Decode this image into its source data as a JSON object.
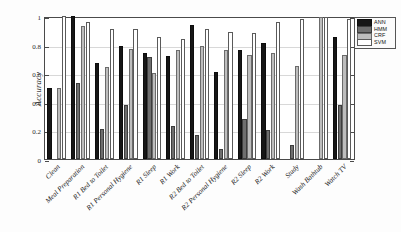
{
  "chart_data": {
    "type": "bar",
    "title": "",
    "xlabel": "",
    "ylabel": "Accuracy",
    "ylim": [
      0,
      1
    ],
    "yticks": [
      0,
      0.2,
      0.4,
      0.6,
      0.8,
      1
    ],
    "ytick_labels": [
      "0",
      "0.2",
      "0.4",
      "0.6",
      "0.8",
      "1"
    ],
    "grid": true,
    "legend_position": "top-right",
    "categories": [
      "Clean",
      "Meal Preparation",
      "R1 Bed to Toilet",
      "R1 Personal Hygiene",
      "R1 Sleep",
      "R1 Work",
      "R2 Bed to Toilet",
      "R2 Personal Hygiene",
      "R2 Sleep",
      "R2 Work",
      "Study",
      "Wash Bathtub",
      "Watch TV"
    ],
    "series": [
      {
        "name": "ANN",
        "color": "#161616",
        "values": [
          0.5,
          1.0,
          0.67,
          0.79,
          0.74,
          0.72,
          0.94,
          0.61,
          0.76,
          0.81,
          0.0,
          0.0,
          0.85
        ]
      },
      {
        "name": "HMM",
        "color": "#6e6e6e",
        "values": [
          0.0,
          0.53,
          0.21,
          0.38,
          0.71,
          0.23,
          0.17,
          0.07,
          0.28,
          0.2,
          0.1,
          0.0,
          0.38
        ]
      },
      {
        "name": "CRF",
        "color": "#bdbdbd",
        "values": [
          0.5,
          0.93,
          0.64,
          0.77,
          0.6,
          0.76,
          0.79,
          0.76,
          0.73,
          0.74,
          0.65,
          0.99,
          0.73
        ]
      },
      {
        "name": "SVM",
        "color": "#ffffff",
        "values": [
          1.0,
          0.96,
          0.91,
          0.91,
          0.85,
          0.84,
          0.91,
          0.89,
          0.88,
          0.96,
          0.98,
          0.99,
          0.98
        ]
      }
    ]
  }
}
